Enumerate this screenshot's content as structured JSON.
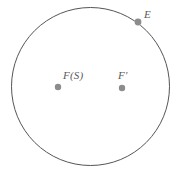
{
  "figure": {
    "background_color": "#ffffff",
    "width": 185,
    "height": 181
  },
  "circle": {
    "name": "circle-outline",
    "center_x": 90.5,
    "center_y": 86.5,
    "radius": 79,
    "stroke_color": "#555555",
    "stroke_width": 1,
    "fill_color": "#ffffff"
  },
  "points": [
    {
      "id": "fs",
      "label": "F(S)",
      "x": 58,
      "y": 87,
      "radius": 3.2,
      "color": "#8c8c8c",
      "location": "interior-left"
    },
    {
      "id": "f-prime",
      "label": "F′",
      "x": 122,
      "y": 88,
      "radius": 3.2,
      "color": "#8c8c8c",
      "location": "interior-right"
    },
    {
      "id": "e",
      "label": "E",
      "x": 138,
      "y": 22,
      "radius": 3.4,
      "color": "#8c8c8c",
      "location": "on-boundary-top-right"
    }
  ],
  "chart_data": {
    "type": "scatter",
    "title": "",
    "xlabel": "",
    "ylabel": "",
    "grid": false,
    "legend": "none",
    "annotations": [
      "F(S)",
      "F′",
      "E"
    ],
    "shapes": [
      {
        "kind": "circle",
        "cx": 90.5,
        "cy": 86.5,
        "r": 79,
        "filled": false
      }
    ],
    "x": [
      58,
      122,
      138
    ],
    "y": [
      87,
      88,
      22
    ],
    "labels": [
      "F(S)",
      "F′",
      "E"
    ]
  }
}
